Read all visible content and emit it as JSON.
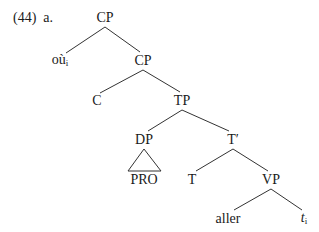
{
  "example": {
    "number": "(44)",
    "letter": "a."
  },
  "nodes": {
    "cp_top": {
      "label": "CP",
      "x": 105,
      "y": 18
    },
    "ou": {
      "label": "où",
      "sub": "i",
      "x": 60,
      "y": 61
    },
    "cp_mid": {
      "label": "CP",
      "x": 143,
      "y": 61
    },
    "c": {
      "label": "C",
      "x": 97,
      "y": 101
    },
    "tp": {
      "label": "TP",
      "x": 182,
      "y": 101
    },
    "dp": {
      "label": "DP",
      "x": 144,
      "y": 140
    },
    "tbar": {
      "label": "T′",
      "x": 233,
      "y": 140
    },
    "pro": {
      "label": "PRO",
      "x": 144,
      "y": 180
    },
    "t": {
      "label": "T",
      "x": 192,
      "y": 180
    },
    "vp": {
      "label": "VP",
      "x": 271,
      "y": 180
    },
    "aller": {
      "label": "aller",
      "x": 228,
      "y": 219
    },
    "trace": {
      "label": "t",
      "sub": "i",
      "x": 304,
      "y": 219
    }
  },
  "colors": {
    "line": "#333333",
    "text": "#1a1a1a"
  }
}
